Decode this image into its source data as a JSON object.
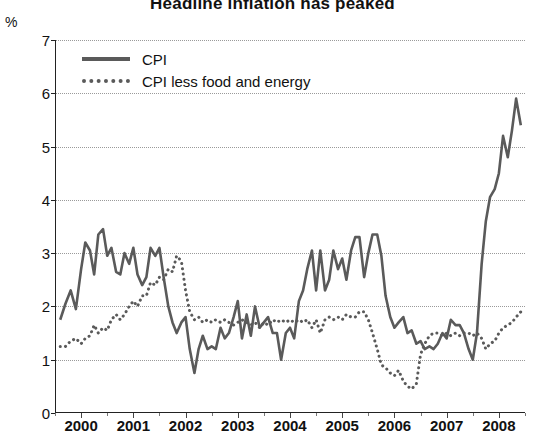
{
  "chart_title": "Headline inflation has peaked",
  "y_unit": "%",
  "legend": {
    "position": "top-left",
    "entries": [
      {
        "label": "CPI",
        "style": "solid",
        "color": "#5a5a5a"
      },
      {
        "label": "CPI less food and energy",
        "style": "dotted",
        "color": "#5a5a5a"
      }
    ]
  },
  "chart_data": {
    "type": "line",
    "title": "Headline inflation has peaked",
    "xlabel": "",
    "ylabel": "%",
    "ylim": [
      0,
      7
    ],
    "yticks": [
      0,
      1,
      2,
      3,
      4,
      5,
      6,
      7
    ],
    "grid": true,
    "xlim": [
      1999.5,
      2008.5
    ],
    "xticks": [
      2000,
      2001,
      2002,
      2003,
      2004,
      2005,
      2006,
      2007,
      2008
    ],
    "xtick_labels": [
      "2000",
      "2001",
      "2002",
      "2003",
      "2004",
      "2005",
      "2006",
      "2007",
      "2008"
    ],
    "x": [
      1999.6,
      1999.7,
      1999.8,
      1999.9,
      2000.0,
      2000.08,
      2000.17,
      2000.25,
      2000.33,
      2000.42,
      2000.5,
      2000.58,
      2000.67,
      2000.75,
      2000.83,
      2000.92,
      2001.0,
      2001.08,
      2001.17,
      2001.25,
      2001.33,
      2001.42,
      2001.5,
      2001.58,
      2001.67,
      2001.75,
      2001.83,
      2001.92,
      2002.0,
      2002.08,
      2002.17,
      2002.25,
      2002.33,
      2002.42,
      2002.5,
      2002.58,
      2002.67,
      2002.75,
      2002.83,
      2002.92,
      2003.0,
      2003.08,
      2003.17,
      2003.25,
      2003.33,
      2003.42,
      2003.5,
      2003.58,
      2003.67,
      2003.75,
      2003.83,
      2003.92,
      2004.0,
      2004.08,
      2004.17,
      2004.25,
      2004.33,
      2004.42,
      2004.5,
      2004.58,
      2004.67,
      2004.75,
      2004.83,
      2004.92,
      2005.0,
      2005.08,
      2005.17,
      2005.25,
      2005.33,
      2005.42,
      2005.5,
      2005.58,
      2005.67,
      2005.75,
      2005.83,
      2005.92,
      2006.0,
      2006.08,
      2006.17,
      2006.25,
      2006.33,
      2006.42,
      2006.5,
      2006.58,
      2006.67,
      2006.75,
      2006.83,
      2006.92,
      2007.0,
      2007.08,
      2007.17,
      2007.25,
      2007.33,
      2007.42,
      2007.5,
      2007.58,
      2007.67,
      2007.75,
      2007.83,
      2007.92,
      2008.0,
      2008.08,
      2008.17,
      2008.25,
      2008.33,
      2008.42
    ],
    "series": [
      {
        "name": "CPI",
        "style": "solid",
        "color": "#5a5a5a",
        "values": [
          1.75,
          2.05,
          2.3,
          1.95,
          2.7,
          3.2,
          3.05,
          2.6,
          3.35,
          3.45,
          2.95,
          3.1,
          2.65,
          2.6,
          3.0,
          2.8,
          3.1,
          2.6,
          2.4,
          2.55,
          3.1,
          2.95,
          3.1,
          2.55,
          2.0,
          1.7,
          1.5,
          1.7,
          1.8,
          1.2,
          0.75,
          1.2,
          1.45,
          1.2,
          1.25,
          1.2,
          1.6,
          1.4,
          1.5,
          1.8,
          2.1,
          1.4,
          1.85,
          1.45,
          2.0,
          1.6,
          1.7,
          1.8,
          1.5,
          1.5,
          1.0,
          1.5,
          1.6,
          1.4,
          2.1,
          2.3,
          2.7,
          3.05,
          2.3,
          3.05,
          2.3,
          2.5,
          3.05,
          2.7,
          2.9,
          2.5,
          3.05,
          3.3,
          3.3,
          2.55,
          3.0,
          3.35,
          3.35,
          2.95,
          2.2,
          1.8,
          1.6,
          1.7,
          1.8,
          1.5,
          1.55,
          1.3,
          1.35,
          1.2,
          1.25,
          1.2,
          1.3,
          1.5,
          1.4,
          1.75,
          1.65,
          1.65,
          1.5,
          1.2,
          1.0,
          1.5,
          2.8,
          3.6,
          4.05,
          4.2,
          4.5,
          5.2,
          4.8,
          5.3,
          5.9,
          5.4
        ]
      },
      {
        "name": "CPI less food and energy",
        "style": "dotted",
        "color": "#5a5a5a",
        "values": [
          1.25,
          1.25,
          1.35,
          1.4,
          1.3,
          1.4,
          1.45,
          1.65,
          1.5,
          1.6,
          1.55,
          1.75,
          1.85,
          1.75,
          1.85,
          2.0,
          2.1,
          2.0,
          2.2,
          2.2,
          2.45,
          2.4,
          2.55,
          2.5,
          2.7,
          2.65,
          2.95,
          2.85,
          2.3,
          1.9,
          1.75,
          1.8,
          1.7,
          1.75,
          1.7,
          1.75,
          1.7,
          1.75,
          1.7,
          1.65,
          1.7,
          1.75,
          1.7,
          1.65,
          1.7,
          1.6,
          1.7,
          1.65,
          1.75,
          1.7,
          1.75,
          1.7,
          1.75,
          1.7,
          1.75,
          1.7,
          1.75,
          1.6,
          1.75,
          1.5,
          1.75,
          1.8,
          1.75,
          1.8,
          1.75,
          1.85,
          1.8,
          1.8,
          1.9,
          1.9,
          1.75,
          1.5,
          1.2,
          0.9,
          0.85,
          0.75,
          0.7,
          0.8,
          0.6,
          0.5,
          0.45,
          0.55,
          1.1,
          1.3,
          1.45,
          1.5,
          1.5,
          1.45,
          1.5,
          1.45,
          1.5,
          1.45,
          1.5,
          1.5,
          1.45,
          1.5,
          1.4,
          1.2,
          1.3,
          1.35,
          1.5,
          1.6,
          1.65,
          1.7,
          1.8,
          1.9
        ]
      }
    ]
  }
}
